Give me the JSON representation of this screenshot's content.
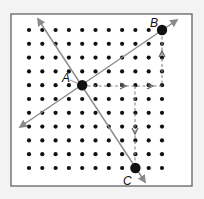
{
  "diagram": {
    "type": "dot-grid-transformation",
    "grid": {
      "columns": 11,
      "rows": 11,
      "x0": 29,
      "y0": 30,
      "dx": 13.3,
      "dy": 13.8
    },
    "frame": {
      "x": 11,
      "y": 14,
      "width": 181,
      "height": 172,
      "stroke": "#555555",
      "fill": "#ffffff"
    },
    "colors": {
      "dot": "#111111",
      "line": "#8a8a8a",
      "dashed": "#888888",
      "point": "#111111"
    },
    "points": [
      {
        "id": "A",
        "label": "A",
        "col": 4,
        "row": 4,
        "label_x": 62,
        "label_y": 82
      },
      {
        "id": "B",
        "label": "B",
        "col": 10,
        "row": 0,
        "label_x": 150,
        "label_y": 27
      },
      {
        "id": "C",
        "label": "C",
        "col": 8,
        "row": 10,
        "label_x": 123,
        "label_y": 185
      }
    ],
    "lines": [
      {
        "name": "line-AB",
        "from": [
          20,
          127
        ],
        "to": [
          177,
          20
        ]
      },
      {
        "name": "line-AC",
        "from": [
          38,
          19
        ],
        "to": [
          145,
          182
        ]
      }
    ],
    "dashed_paths": [
      {
        "name": "path-A-to-B",
        "points": [
          [
            82,
            86
          ],
          [
            162,
            86
          ],
          [
            162,
            30
          ]
        ],
        "arrows": [
          [
            125,
            86,
            "right"
          ],
          [
            152,
            86,
            "right"
          ],
          [
            162,
            52,
            "up"
          ]
        ]
      },
      {
        "name": "path-A-to-C",
        "points": [
          [
            135,
            86
          ],
          [
            135,
            168
          ]
        ],
        "arrows": [
          [
            135,
            133,
            "down"
          ]
        ]
      }
    ]
  }
}
